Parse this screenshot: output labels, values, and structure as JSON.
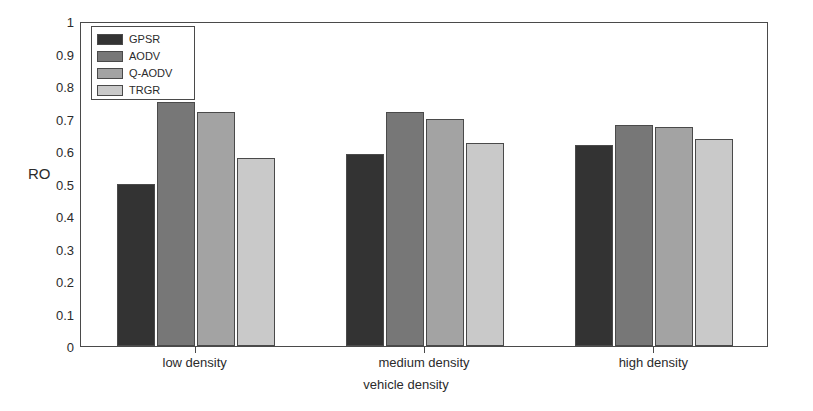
{
  "chart_data": {
    "type": "bar",
    "title": "",
    "xlabel": "vehicle density",
    "ylabel": "RO",
    "categories": [
      "low density",
      "medium density",
      "high density"
    ],
    "series": [
      {
        "name": "GPSR",
        "color": "#333333",
        "values": [
          0.5,
          0.59,
          0.62
        ]
      },
      {
        "name": "AODV",
        "color": "#777777",
        "values": [
          0.75,
          0.72,
          0.68
        ]
      },
      {
        "name": "Q-AODV",
        "color": "#a3a3a3",
        "values": [
          0.72,
          0.7,
          0.675
        ]
      },
      {
        "name": "TRGR",
        "color": "#c9c9c9",
        "values": [
          0.58,
          0.625,
          0.637
        ]
      }
    ],
    "ylim": [
      0,
      1
    ],
    "ytick_labels": [
      "0",
      "0.1",
      "0.2",
      "0.3",
      "0.4",
      "0.5",
      "0.6",
      "0.7",
      "0.8",
      "0.9",
      "1"
    ],
    "ytick_values": [
      0,
      0.1,
      0.2,
      0.3,
      0.4,
      0.5,
      0.6,
      0.7,
      0.8,
      0.9,
      1
    ],
    "grid": false,
    "legend_position": "upper-left",
    "legend_entries": [
      "GPSR",
      "AODV",
      "Q-AODV",
      "TRGR"
    ]
  }
}
